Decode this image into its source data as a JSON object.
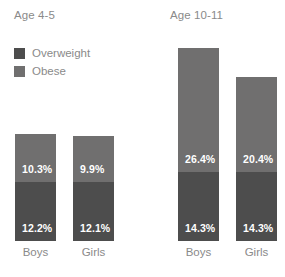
{
  "legend": {
    "items": [
      {
        "label": "Overweight",
        "color": "#4d4d4d",
        "name": "legend-overweight"
      },
      {
        "label": "Obese",
        "color": "#706f6f",
        "name": "legend-obese"
      }
    ]
  },
  "groups": [
    {
      "title": "Age 4-5"
    },
    {
      "title": "Age 10-11"
    }
  ],
  "bars": [
    {
      "group": "Age 4-5",
      "category": "Boys",
      "top_value": "10.3%",
      "bottom_value": "12.2%",
      "left": 15,
      "top": 134,
      "boundary": 182,
      "baseline": 241
    },
    {
      "group": "Age 4-5",
      "category": "Girls",
      "top_value": "9.9%",
      "bottom_value": "12.1%",
      "left": 73,
      "top": 136,
      "boundary": 182,
      "baseline": 241
    },
    {
      "group": "Age 10-11",
      "category": "Boys",
      "top_value": "26.4%",
      "bottom_value": "14.3%",
      "left": 178,
      "top": 48,
      "boundary": 172,
      "baseline": 241
    },
    {
      "group": "Age 10-11",
      "category": "Girls",
      "top_value": "20.4%",
      "bottom_value": "14.3%",
      "left": 236,
      "top": 77,
      "boundary": 172,
      "baseline": 241
    }
  ],
  "chart_data": {
    "type": "bar",
    "title": "",
    "subtitle": "",
    "xlabel": "",
    "ylabel": "",
    "stacked": true,
    "grid": false,
    "legend_position": "top-left",
    "panels": [
      {
        "title": "Age 4-5",
        "categories": [
          "Boys",
          "Girls"
        ],
        "series": [
          {
            "name": "Overweight",
            "values": [
              12.2,
              12.1
            ],
            "color": "#4d4d4d"
          },
          {
            "name": "Obese",
            "values": [
              10.3,
              9.9
            ],
            "color": "#706f6f"
          }
        ],
        "totals": [
          22.5,
          22.0
        ]
      },
      {
        "title": "Age 10-11",
        "categories": [
          "Boys",
          "Girls"
        ],
        "series": [
          {
            "name": "Overweight",
            "values": [
              14.3,
              14.3
            ],
            "color": "#4d4d4d"
          },
          {
            "name": "Obese",
            "values": [
              26.4,
              20.4
            ],
            "color": "#706f6f"
          }
        ],
        "totals": [
          40.7,
          34.7
        ]
      }
    ],
    "value_labels": [
      "10.3%",
      "12.2%",
      "9.9%",
      "12.1%",
      "26.4%",
      "14.3%",
      "20.4%",
      "14.3%"
    ],
    "ylim": [
      0,
      41
    ],
    "units": "percent"
  },
  "colors": {
    "overweight": "#4d4d4d",
    "obese": "#706f6f",
    "text_muted": "#8a8a8a",
    "label_text": "#ffffff",
    "background": "#ffffff"
  }
}
